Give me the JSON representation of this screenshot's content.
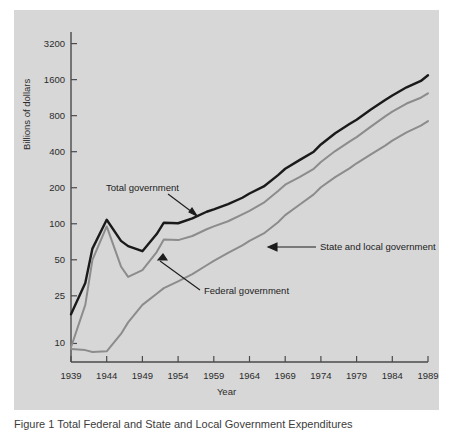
{
  "figure": {
    "panel_bg": "#d7d7d7",
    "page_bg": "#ffffff",
    "caption": "Figure 1   Total Federal and State and Local Government Expenditures"
  },
  "chart_data": {
    "type": "line",
    "title": "",
    "xlabel": "Year",
    "ylabel": "Billions of dollars",
    "yscale": "log",
    "grid": false,
    "legend_position": "inline-annotations",
    "ylim": [
      7,
      4000
    ],
    "xlim": [
      1939,
      1989
    ],
    "ytick_labels": [
      "10",
      "25",
      "50",
      "100",
      "200",
      "400",
      "800",
      "1600",
      "3200"
    ],
    "ytick_values": [
      10,
      25,
      50,
      100,
      200,
      400,
      800,
      1600,
      3200
    ],
    "xtick_labels": [
      "1939",
      "1944",
      "1949",
      "1954",
      "1959",
      "1964",
      "1969",
      "1974",
      "1979",
      "1984",
      "1989"
    ],
    "xtick_values": [
      1939,
      1944,
      1949,
      1954,
      1959,
      1964,
      1969,
      1974,
      1979,
      1984,
      1989
    ],
    "x": [
      1939,
      1941,
      1942,
      1944,
      1946,
      1947,
      1949,
      1951,
      1952,
      1954,
      1956,
      1958,
      1959,
      1961,
      1963,
      1964,
      1966,
      1968,
      1969,
      1971,
      1973,
      1974,
      1976,
      1978,
      1979,
      1981,
      1983,
      1984,
      1986,
      1988,
      1989
    ],
    "series": [
      {
        "name": "Total government",
        "color": "#1a1a1a",
        "values": [
          17.5,
          32,
          62,
          108,
          72,
          65,
          59,
          82,
          102,
          101,
          111,
          126,
          132,
          146,
          165,
          179,
          205,
          255,
          288,
          340,
          400,
          460,
          570,
          680,
          740,
          900,
          1080,
          1180,
          1380,
          1560,
          1740
        ]
      },
      {
        "name": "Federal government",
        "color": "#8c8c8c",
        "values": [
          9.3,
          21,
          50,
          95,
          44,
          36,
          41,
          58,
          74,
          73,
          79,
          90,
          95,
          105,
          120,
          128,
          150,
          188,
          212,
          245,
          288,
          328,
          405,
          485,
          530,
          648,
          790,
          865,
          1010,
          1130,
          1230
        ]
      },
      {
        "name": "State and local government",
        "color": "#8c8c8c",
        "values": [
          9.0,
          8.8,
          8.5,
          8.6,
          12,
          15,
          21,
          26,
          29,
          33,
          38,
          45,
          49,
          57,
          66,
          72,
          83,
          103,
          118,
          144,
          176,
          202,
          245,
          290,
          320,
          380,
          450,
          495,
          580,
          660,
          720
        ]
      }
    ]
  },
  "annotations": [
    {
      "name": "total-government-label",
      "text": "Total government"
    },
    {
      "name": "state-and-local-government-label",
      "text": "State and local government"
    },
    {
      "name": "federal-government-label",
      "text": "Federal government"
    }
  ]
}
